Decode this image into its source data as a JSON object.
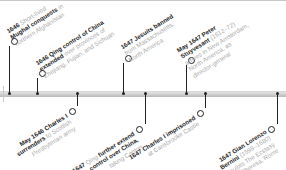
{
  "timeline": {
    "above": [
      {
        "year": "1646",
        "bold": "Mughal conquests",
        "pre": "Short-lived",
        "post": "in northern Afghanistan",
        "lines": [
          [
            "1646",
            "b",
            " Short-lived",
            ""
          ],
          [
            "Mughal conquests",
            "b",
            " in",
            ""
          ],
          [
            "northern Afghanistan",
            "",
            "",
            " "
          ]
        ]
      },
      {
        "year": "1646",
        "lines": [
          [
            "1646 Qing control of China",
            "b"
          ],
          [
            "extended",
            "b",
            " over provinces of"
          ],
          [
            "Zhejiang, Fujian, and Sichuan",
            ""
          ]
        ]
      },
      {
        "year": "1647",
        "lines": [
          [
            "1647 Jesuits banned",
            "b"
          ],
          [
            "from Massachusetts,",
            ""
          ],
          [
            "North America",
            ""
          ]
        ]
      },
      {
        "year": "May 1647",
        "lines": [
          [
            "May 1647 Peter",
            "b"
          ],
          [
            "Stuyvesant",
            "b",
            " (1612–72)"
          ],
          [
            "arrives in New Amsterdam,",
            ""
          ],
          [
            "North America, as",
            ""
          ],
          [
            "director-general",
            ""
          ]
        ]
      }
    ],
    "below": [
      {
        "year": "May 1646",
        "lines": [
          [
            "May 1646 Charles I",
            "b"
          ],
          [
            "surrenders",
            "b",
            " to Scottish"
          ],
          [
            "Presbyterian army",
            ""
          ]
        ]
      },
      {
        "year": "1647",
        "lines": [
          [
            "Qing further extend",
            "b"
          ],
          [
            "1647",
            "b",
            " Qing ",
            "",
            "control over China,",
            "b"
          ],
          [
            "taking Canton",
            ""
          ]
        ]
      },
      {
        "year": "1647",
        "lines": [
          [
            "1647 Charles I imprisoned",
            "b"
          ],
          [
            "at Carisbrooke Castle",
            ""
          ]
        ]
      },
      {
        "year": "1647",
        "lines": [
          [
            "1647 Gian Lorenzo",
            "b"
          ],
          [
            "Bernini",
            "b",
            " (1598–1680)"
          ],
          [
            "sculpts ",
            "",
            "The Ecstasy",
            ""
          ],
          [
            "of St Theresa",
            "",
            " Rome"
          ]
        ]
      }
    ]
  },
  "events": {
    "e1": {
      "b1": "1646",
      "t1": " Short-lived",
      "b2": "Mughal conquests",
      "t2": " in",
      "t3": "northern Afghanistan"
    },
    "e2": {
      "b1": "1646 Qing control of China",
      "b2": "extended",
      "t2": " over provinces of",
      "t3": "Zhejiang, Fujian, and Sichuan"
    },
    "e3": {
      "b1": "1647 Jesuits banned",
      "t2": "from Massachusetts,",
      "t3": "North America"
    },
    "e4": {
      "b1": "May 1647 Peter",
      "b2": "Stuyvesant",
      "t2": " (1612–72)",
      "t3": "arrives in New Amsterdam,",
      "t4": "North America, as",
      "t5": "director-general"
    },
    "e5": {
      "b1": "May 1646 Charles I",
      "b2": "surrenders",
      "t2": " to Scottish",
      "t3": "Presbyterian army"
    },
    "e6": {
      "b0": "1647",
      "t0": " Qing ",
      "b1": "further extend",
      "b2": "control over China,",
      "t3": "taking Canton"
    },
    "e7": {
      "b1": "1647 Charles I imprisoned",
      "t2": "at Carisbrooke Castle"
    },
    "e8": {
      "b1": "1647 Gian Lorenzo",
      "b2": "Bernini",
      "t2": " (1598–1680)",
      "t3": "sculpts The Ecstasy",
      "t4": "of St Theresa, Rome"
    }
  },
  "colors": {
    "bold_text": "#1e1e1e",
    "light_text": "#a9a9a9",
    "bar": "#c4c4c4",
    "line": "#222222"
  }
}
